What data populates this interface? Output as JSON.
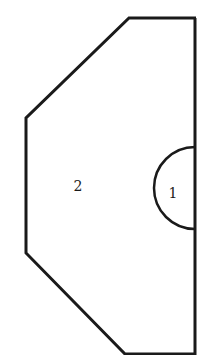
{
  "diagram": {
    "type": "region-diagram",
    "regions": [
      {
        "id": "region-1",
        "label": "1",
        "shape": "semicircle"
      },
      {
        "id": "region-2",
        "label": "2",
        "shape": "polygon"
      }
    ],
    "colors": {
      "stroke": "#1a1a1a",
      "background": "#ffffff"
    }
  }
}
